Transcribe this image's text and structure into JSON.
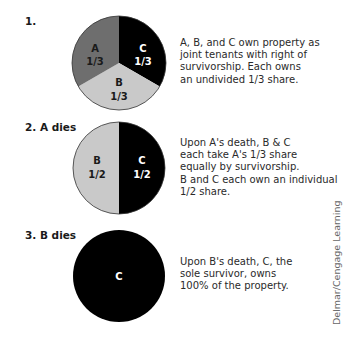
{
  "diagram": {
    "steps": [
      {
        "label": "1.",
        "pie": {
          "segments": [
            {
              "owner": "A",
              "share": "1/3",
              "color": "#6e6e6e",
              "text_color": "#1a1a1a"
            },
            {
              "owner": "B",
              "share": "1/3",
              "color": "#c9c9c9",
              "text_color": "#1a1a1a"
            },
            {
              "owner": "C",
              "share": "1/3",
              "color": "#000000",
              "text_color": "#ffffff"
            }
          ]
        },
        "description": [
          "A, B, and C own property as",
          "joint tenants with right of",
          "survivorship. Each owns",
          "an undivided 1/3 share."
        ]
      },
      {
        "label": "2. A dies",
        "pie": {
          "segments": [
            {
              "owner": "B",
              "share": "1/2",
              "color": "#c9c9c9",
              "text_color": "#1a1a1a"
            },
            {
              "owner": "C",
              "share": "1/2",
              "color": "#000000",
              "text_color": "#ffffff"
            }
          ]
        },
        "description": [
          "Upon A's death, B & C",
          "each take A's 1/3 share",
          "equally by survivorship.",
          "B and C each own an individual",
          "1/2 share."
        ]
      },
      {
        "label": "3. B dies",
        "pie": {
          "segments": [
            {
              "owner": "C",
              "share": "",
              "color": "#000000",
              "text_color": "#ffffff"
            }
          ]
        },
        "description": [
          "Upon B's death, C, the",
          "sole survivor, owns",
          "100% of the property."
        ]
      }
    ],
    "credit": "Delmar/Cengage Learning"
  }
}
